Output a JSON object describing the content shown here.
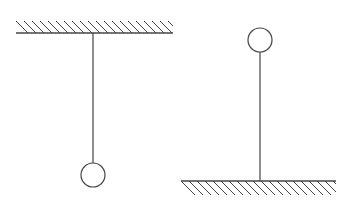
{
  "diagram": {
    "title": "",
    "stroke_color": "#444444",
    "background": "#ffffff",
    "figures": [
      {
        "id": "hanging-pendulum",
        "ceiling": {
          "x1": 16,
          "x2": 173,
          "y": 33,
          "hatch_height": 12,
          "hatch_side": "above"
        },
        "rod": {
          "x": 93,
          "y1": 33,
          "y2": 163
        },
        "bob": {
          "cx": 93,
          "cy": 175,
          "r": 12
        }
      },
      {
        "id": "inverted-pendulum",
        "floor": {
          "x1": 181,
          "x2": 336,
          "y": 181,
          "hatch_height": 14,
          "hatch_side": "below"
        },
        "rod": {
          "x": 260,
          "y1": 52,
          "y2": 181
        },
        "bob": {
          "cx": 260,
          "cy": 40,
          "r": 12
        }
      }
    ]
  }
}
